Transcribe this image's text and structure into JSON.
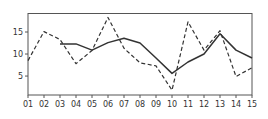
{
  "chart_data": {
    "type": "line",
    "title": "",
    "xlabel": "",
    "ylabel": "",
    "categories": [
      "01",
      "02",
      "03",
      "04",
      "05",
      "06",
      "07",
      "08",
      "09",
      "10",
      "11",
      "12",
      "13",
      "14",
      "15"
    ],
    "series": [
      {
        "name": "dashed",
        "style": "dashed",
        "color": "#333333",
        "values": [
          8.5,
          15.1,
          13.3,
          7.8,
          10.8,
          18.3,
          11.3,
          8.0,
          7.3,
          1.8,
          17.3,
          10.9,
          15.3,
          4.9,
          6.9
        ]
      },
      {
        "name": "solid",
        "style": "solid",
        "color": "#333333",
        "values": [
          null,
          null,
          12.3,
          12.3,
          10.9,
          12.6,
          13.6,
          12.5,
          9.1,
          5.6,
          8.2,
          10.0,
          14.6,
          10.9,
          9.1
        ]
      }
    ],
    "yticks": [
      5,
      10,
      15
    ],
    "ylim": [
      0.7,
      19.2
    ],
    "xlim": [
      "01",
      "15"
    ],
    "grid": false,
    "legend": null
  },
  "axis": {
    "ytick_labels": [
      "5",
      "10",
      "15"
    ]
  }
}
